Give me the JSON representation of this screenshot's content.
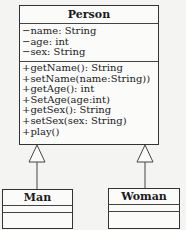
{
  "diagram": {
    "type": "UML class diagram",
    "classes": {
      "person": {
        "name": "Person",
        "attributes": [
          "−name: String",
          "−age: int",
          "−sex: String"
        ],
        "operations": [
          "+getName(): String",
          "+setName(name:String))",
          "+getAge(): int",
          "+SetAge(age:int)",
          "+getSex(): String",
          "+setSex(sex: String)",
          "+play()"
        ]
      },
      "man": {
        "name": "Man",
        "attributes": [],
        "operations": []
      },
      "woman": {
        "name": "Woman",
        "attributes": [],
        "operations": []
      }
    },
    "relationships": [
      {
        "type": "generalization",
        "from": "Man",
        "to": "Person"
      },
      {
        "type": "generalization",
        "from": "Woman",
        "to": "Person"
      }
    ]
  }
}
